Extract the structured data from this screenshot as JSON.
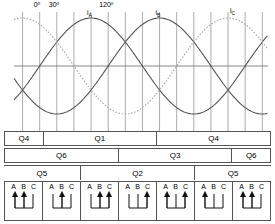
{
  "colors": {
    "grid": "#8a8a8a",
    "axis": "#6b6b6b",
    "phase_a": "#555555",
    "phase_b": "#555555",
    "phase_c": "#aaaaaa",
    "border": "#555555",
    "text": "#000000"
  },
  "plot": {
    "angle_labels": [
      {
        "text": "0º",
        "deg": 0
      },
      {
        "text": "30º",
        "deg": 30
      },
      {
        "text": "120º",
        "deg": 120
      }
    ],
    "curve_labels": [
      {
        "text": "i",
        "sub": "A",
        "deg": 90
      },
      {
        "text": "i",
        "sub": "B",
        "deg": 210
      },
      {
        "text": "i",
        "sub": "C",
        "deg": 330
      }
    ],
    "gridline_degrees": [
      -30,
      0,
      30,
      60,
      90,
      120,
      150,
      180,
      210,
      240,
      270,
      300,
      330,
      360,
      390
    ],
    "zero_axis": true
  },
  "chart_data": {
    "type": "line",
    "xlabel": "Electrical angle (degrees)",
    "ylabel": "Current",
    "xlim": [
      -45,
      400
    ],
    "ylim": [
      -1.15,
      1.15
    ],
    "grid": true,
    "legend": "inline-labels",
    "x": [
      0,
      30,
      60,
      90,
      120,
      150,
      180,
      210,
      240,
      270,
      300,
      330,
      360
    ],
    "series": [
      {
        "name": "i_A",
        "phase_deg": 0,
        "amplitude": 1,
        "style": "solid",
        "color": "#555555",
        "values": [
          0,
          0.5,
          0.866,
          1,
          0.866,
          0.5,
          0,
          -0.5,
          -0.866,
          -1,
          -0.866,
          -0.5,
          0
        ]
      },
      {
        "name": "i_B",
        "phase_deg": -120,
        "amplitude": 1,
        "style": "solid",
        "color": "#555555",
        "values": [
          -0.866,
          -0.5,
          0,
          0.5,
          0.866,
          1,
          0.866,
          0.5,
          0,
          -0.5,
          -0.866,
          -1,
          -0.866
        ]
      },
      {
        "name": "i_C",
        "phase_deg": 120,
        "amplitude": 1,
        "style": "dotted",
        "color": "#aaaaaa",
        "values": [
          0.866,
          1,
          0.866,
          0.5,
          0,
          -0.5,
          -0.866,
          -1,
          -0.866,
          -0.5,
          0,
          0.5,
          0.866
        ]
      }
    ]
  },
  "bands": {
    "row1": [
      {
        "label": "Q4",
        "span": 1
      },
      {
        "label": "Q1",
        "span": 3
      },
      {
        "label": "Q4",
        "span": 3
      }
    ],
    "row2": [
      {
        "label": "Q6",
        "span": 3
      },
      {
        "label": "Q3",
        "span": 3
      },
      {
        "label": "Q6",
        "span": 1
      }
    ],
    "row3": [
      {
        "label": "Q5",
        "span": 2
      },
      {
        "label": "Q2",
        "span": 3
      },
      {
        "label": "Q5",
        "span": 2
      }
    ]
  },
  "switch_states": {
    "phase_headers": [
      "A",
      "B",
      "C"
    ],
    "cells": [
      {
        "index": 1,
        "arrows": [
          "up",
          "up",
          "down"
        ]
      },
      {
        "index": 2,
        "arrows": [
          "down",
          "up",
          "down"
        ]
      },
      {
        "index": 3,
        "arrows": [
          "down",
          "up",
          "up"
        ]
      },
      {
        "index": 4,
        "arrows": [
          "down",
          "down",
          "up"
        ]
      },
      {
        "index": 5,
        "arrows": [
          "up",
          "down",
          "up"
        ]
      },
      {
        "index": 6,
        "arrows": [
          "up",
          "down",
          "down"
        ]
      },
      {
        "index": 7,
        "arrows": [
          "up",
          "up",
          "down"
        ]
      }
    ]
  }
}
